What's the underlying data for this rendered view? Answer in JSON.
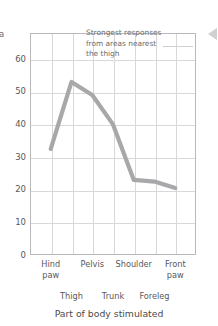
{
  "chart_data": {
    "type": "line",
    "title": "",
    "xlabel": "Part of body stimulated",
    "ylabel": "a",
    "categories": [
      "Hind paw",
      "Thigh",
      "Pelvis",
      "Trunk",
      "Shoulder",
      "Foreleg",
      "Front paw"
    ],
    "values": [
      32.5,
      53,
      49,
      40,
      23,
      22.5,
      20.5
    ],
    "ylim": [
      0,
      68
    ],
    "yticks": [
      0,
      10,
      20,
      30,
      40,
      50,
      60
    ],
    "ytick_labels": [
      "0",
      "10",
      "20",
      "30",
      "40",
      "50",
      "60"
    ],
    "xtick_rows": [
      [
        "Hind paw",
        "Pelvis",
        "Shoulder",
        "Front paw"
      ],
      [
        "Thigh",
        "Trunk",
        "Foreleg"
      ]
    ],
    "grid": true,
    "legend": "none",
    "line_color": "#a8a8aa",
    "grid_color": "#d8d8da",
    "axis_color": "#b9b9bb",
    "text_color": "#58585a",
    "annotations": [
      {
        "lines": [
          "Strongest responses",
          "from areas nearest",
          "the thigh"
        ],
        "has_leader_line": true
      }
    ]
  },
  "axis": {
    "y_label_clipped": "a",
    "x_title": "Part of body stimulated"
  },
  "icons": {
    "edge_chevron": "chevron-left-icon"
  }
}
